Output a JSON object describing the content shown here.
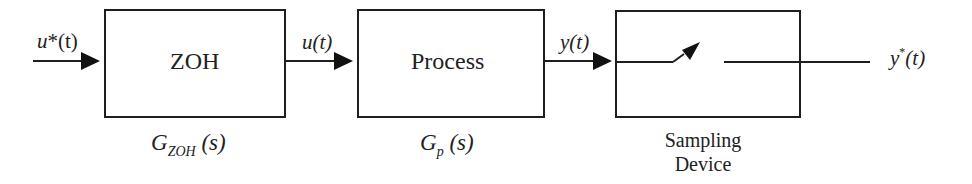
{
  "diagram": {
    "type": "block-diagram",
    "blocks": [
      {
        "id": "zoh",
        "label": "ZOH",
        "transfer_function": {
          "symbol": "G",
          "subscript": "ZOH",
          "arg": "(s)"
        }
      },
      {
        "id": "process",
        "label": "Process",
        "transfer_function": {
          "symbol": "G",
          "subscript": "p",
          "arg": "(s)"
        }
      },
      {
        "id": "sampler",
        "label": "",
        "caption": [
          "Sampling",
          "Device"
        ]
      }
    ],
    "signals": {
      "input": {
        "base": "u",
        "mark": "*",
        "arg": "(t)"
      },
      "zoh_out": {
        "base": "u",
        "arg": "(t)"
      },
      "process_out": {
        "base": "y",
        "arg": "(t)"
      },
      "output": {
        "base": "y",
        "mark": "*",
        "arg": "(t)"
      }
    },
    "colors": {
      "stroke": "#1e1e1e",
      "background": "#ffffff"
    }
  }
}
